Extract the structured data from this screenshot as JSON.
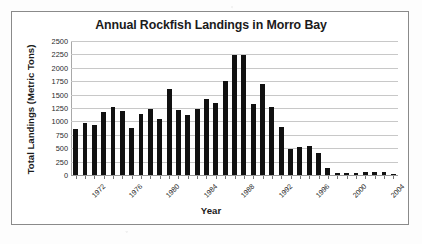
{
  "chart_data": {
    "type": "bar",
    "title": "Annual Rockfish Landings in Morro Bay",
    "xlabel": "Year",
    "ylabel": "Total Landings (Metric Tons)",
    "ylim": [
      0,
      2500
    ],
    "ytick_step": 250,
    "yticks": [
      2500,
      2250,
      2000,
      1750,
      1500,
      1250,
      1000,
      750,
      500,
      250,
      0
    ],
    "ytick_labels": [
      "2500",
      "2250",
      "2000",
      "1750",
      "1500",
      "1250",
      "1000",
      "750",
      "500",
      "250",
      "0"
    ],
    "grid": true,
    "legend": false,
    "bar_color": "#111111",
    "xtick_labels": [
      "1972",
      "1976",
      "1980",
      "1984",
      "1988",
      "1992",
      "1996",
      "2000",
      "2004"
    ],
    "xtick_interval": 4,
    "categories": [
      "1972",
      "1973",
      "1974",
      "1975",
      "1976",
      "1977",
      "1978",
      "1979",
      "1980",
      "1981",
      "1982",
      "1983",
      "1984",
      "1985",
      "1986",
      "1987",
      "1988",
      "1989",
      "1990",
      "1991",
      "1992",
      "1993",
      "1994",
      "1995",
      "1996",
      "1997",
      "1998",
      "1999",
      "2000",
      "2001",
      "2002",
      "2003",
      "2004",
      "2005",
      "2006"
    ],
    "values": [
      850,
      970,
      925,
      1180,
      1270,
      1190,
      875,
      1145,
      1240,
      1045,
      1600,
      1210,
      1120,
      1235,
      1415,
      1350,
      1760,
      2240,
      2240,
      1325,
      1700,
      1270,
      900,
      485,
      515,
      545,
      405,
      135,
      30,
      35,
      45,
      50,
      60,
      55,
      25
    ]
  },
  "figure": {
    "frame_border_color": "#8a8a8a",
    "background_color": "#ffffff"
  }
}
